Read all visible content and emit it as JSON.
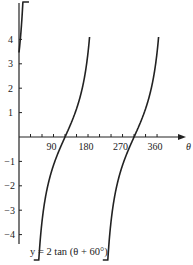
{
  "chart_data": {
    "type": "line",
    "title": "",
    "function": "y = 2 tan (θ + 60°)",
    "caption": "y = 2 tan (θ + 60°)",
    "xlabel": "θ",
    "ylabel": "",
    "xlim": [
      0,
      390
    ],
    "ylim": [
      -4.6,
      5.5
    ],
    "x_ticks": [
      90,
      180,
      270,
      360
    ],
    "x_minor_tick_step": 30,
    "y_ticks": [
      -4,
      -3,
      -2,
      -1,
      1,
      2,
      3,
      4
    ],
    "y_tick_labels": [
      "−4",
      "−3",
      "−2",
      "−1",
      "1",
      "2",
      "3",
      "4"
    ],
    "x_tick_labels": [
      "90",
      "180",
      "270",
      "360"
    ],
    "grid": false,
    "legend": null,
    "asymptotes": [
      30,
      210
    ],
    "zero_crossings": [
      120,
      300
    ],
    "y_intercept": 3.46,
    "series": [
      {
        "name": "branch-1",
        "x": [
          0,
          10,
          20,
          25
        ],
        "values": [
          3.46,
          4.77,
          7.5,
          11.4
        ]
      },
      {
        "name": "branch-2",
        "x": [
          38,
          60,
          90,
          110,
          120,
          130,
          150,
          170,
          184
        ],
        "values": [
          -4.3,
          -1.15,
          -0.36,
          -0.07,
          0,
          0.07,
          0.36,
          1.15,
          4.8
        ]
      },
      {
        "name": "branch-3",
        "x": [
          218,
          240,
          270,
          290,
          300,
          310,
          330,
          350,
          364
        ],
        "values": [
          -4.3,
          -1.15,
          -0.36,
          -0.07,
          0,
          0.07,
          0.36,
          1.15,
          4.8
        ]
      }
    ],
    "line_color": "#222222"
  }
}
